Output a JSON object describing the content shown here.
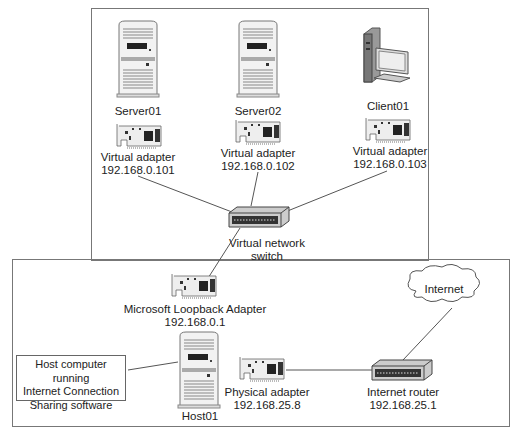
{
  "diagram": {
    "virtual_network": {
      "nodes": [
        {
          "name": "Server01",
          "adapter_label": "Virtual adapter",
          "ip": "192.168.0.101"
        },
        {
          "name": "Server02",
          "adapter_label": "Virtual adapter",
          "ip": "192.168.0.102"
        },
        {
          "name": "Client01",
          "adapter_label": "Virtual adapter",
          "ip": "192.168.0.103"
        }
      ],
      "switch": {
        "line1": "Virtual network",
        "line2": "switch"
      }
    },
    "host_network": {
      "loopback": {
        "label": "Microsoft Loopback Adapter",
        "ip": "192.168.0.1"
      },
      "host": {
        "name": "Host01"
      },
      "callout": {
        "line1": "Host computer running",
        "line2": "Internet Connection",
        "line3": "Sharing software"
      },
      "physical": {
        "label": "Physical adapter",
        "ip": "192.168.25.8"
      },
      "router": {
        "label": "Internet router",
        "ip": "192.168.25.1"
      },
      "cloud": {
        "label": "Internet"
      }
    }
  }
}
